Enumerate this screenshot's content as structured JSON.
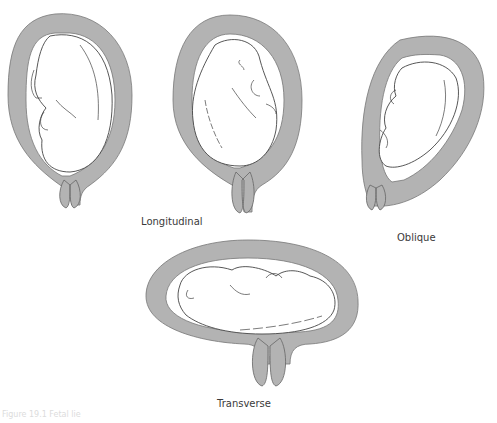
{
  "figure": {
    "panels": [
      {
        "id": "longitudinal-cephalic",
        "label": ""
      },
      {
        "id": "longitudinal-breech",
        "label": "Longitudinal"
      },
      {
        "id": "oblique",
        "label": "Oblique"
      },
      {
        "id": "transverse",
        "label": "Transverse"
      }
    ],
    "caption": "Figure 19.1 Fetal lie"
  },
  "colors": {
    "uterus_wall": "#b3b3b3",
    "outline": "#4a4a4a",
    "fetus_fill": "#ffffff",
    "background": "#ffffff"
  }
}
